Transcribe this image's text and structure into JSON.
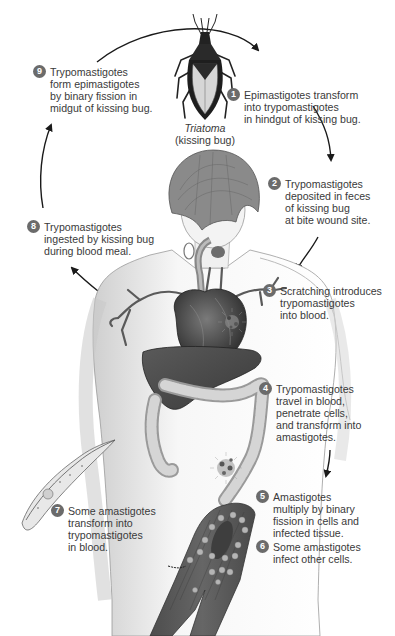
{
  "diagram": {
    "colors": {
      "badge": "#6b6b6b",
      "text": "#3a3a3a",
      "arrow": "#1a1a1a",
      "organ_dark": "#4a4a4a",
      "skin_shade": "#d8d8d8"
    },
    "vector": {
      "name_italic": "Triatoma",
      "common_name": "(kissing bug)"
    },
    "steps": [
      {
        "number": "1",
        "lines": [
          "Epimastigotes transform",
          "into trypomastigotes",
          "in hindgut of kissing bug."
        ]
      },
      {
        "number": "2",
        "lines": [
          "Trypomastigotes",
          "deposited in feces",
          "of kissing bug",
          "at bite wound site."
        ]
      },
      {
        "number": "3",
        "lines": [
          "Scratching introduces",
          "trypomastigotes",
          "into blood."
        ]
      },
      {
        "number": "4",
        "lines": [
          "Trypomastigotes",
          "travel in blood,",
          "penetrate cells,",
          "and transform into",
          "amastigotes."
        ]
      },
      {
        "number": "5",
        "lines": [
          "Amastigotes",
          "multiply by binary",
          "fission in cells and",
          "infected tissue."
        ]
      },
      {
        "number": "6",
        "lines": [
          "Some amastigotes",
          "infect other cells."
        ]
      },
      {
        "number": "7",
        "lines": [
          "Some amastigotes",
          "transform into",
          "trypomastigotes",
          "in blood."
        ]
      },
      {
        "number": "8",
        "lines": [
          "Trypomastigotes",
          "ingested by kissing bug",
          "during blood meal."
        ]
      },
      {
        "number": "9",
        "lines": [
          "Trypomastigotes",
          "form epimastigotes",
          "by binary fission in",
          "midgut of kissing bug."
        ]
      }
    ],
    "illustrations": [
      "kissing-bug",
      "human-figure",
      "heart",
      "liver",
      "colon",
      "esophagus",
      "trypomastigote-parasite",
      "infected-muscle-tissue",
      "infected-tissue-clusters"
    ]
  }
}
